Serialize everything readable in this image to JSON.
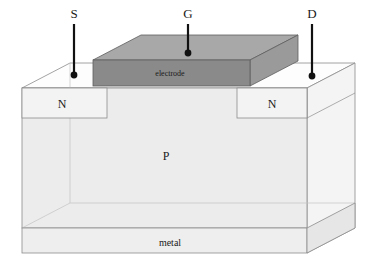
{
  "diagram": {
    "terminals": [
      {
        "id": "source",
        "label": "S",
        "label_x": 74,
        "label_y": 18,
        "lead_x": 74,
        "lead_top": 24,
        "lead_bottom": 75,
        "dot_x": 74,
        "dot_y": 75
      },
      {
        "id": "gate",
        "label": "G",
        "label_x": 188,
        "label_y": 18,
        "lead_x": 188,
        "lead_top": 24,
        "lead_bottom": 53,
        "dot_x": 188,
        "dot_y": 53
      },
      {
        "id": "drain",
        "label": "D",
        "label_x": 312,
        "label_y": 18,
        "lead_x": 312,
        "lead_top": 24,
        "lead_bottom": 76,
        "dot_x": 312,
        "dot_y": 76
      }
    ],
    "regions": [
      {
        "id": "source-n",
        "label": "N",
        "label_x": 62,
        "label_y": 104
      },
      {
        "id": "drain-n",
        "label": "N",
        "label_x": 272,
        "label_y": 104
      },
      {
        "id": "substrate-p",
        "label": "P",
        "label_x": 166,
        "label_y": 159
      }
    ],
    "layers": [
      {
        "id": "gate-electrode",
        "label": "electrode",
        "label_x": 170,
        "label_y": 74
      },
      {
        "id": "back-metal",
        "label": "metal",
        "label_x": 170,
        "label_y": 245
      }
    ],
    "colors": {
      "background": "#ffffff",
      "electrode_top": "#a8a8a8",
      "electrode_front": "#8a8a8a",
      "electrode_right": "#9a9a9a",
      "body_front": "#ececec",
      "body_top": "#fdfdfd",
      "body_right": "#f2f2f2",
      "n_region": "#f3f3f3",
      "metal_front": "#eeeeee",
      "metal_right": "#e6e6e6",
      "outline": "#8c8c8c",
      "outline_faint": "#c3c3c3",
      "lead": "#111111",
      "text": "#1a1a1a"
    },
    "geometry": {
      "front_left_x": 22,
      "front_right_x": 307,
      "back_offset_x": 48,
      "back_offset_y": 25,
      "top_front_y": 88,
      "n_bottom_y": 118,
      "body_bottom_y": 228,
      "metal_bottom_y": 253,
      "electrode": {
        "front_left_x": 93,
        "front_right_x": 250,
        "front_top_y": 60,
        "front_bottom_y": 86,
        "depth_x": 48,
        "depth_y": 25
      }
    }
  }
}
